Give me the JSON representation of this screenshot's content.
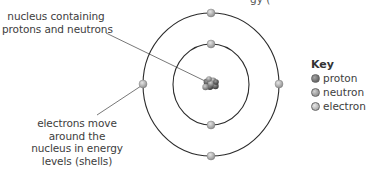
{
  "title_fragment": "gy        (",
  "labels": {
    "nucleus": [
      "nucleus containing",
      "protons and neutrons"
    ],
    "electrons": [
      "electrons move",
      "around the",
      "nucleus in energy",
      "levels (shells)"
    ]
  },
  "key": {
    "title": "Key",
    "items": [
      {
        "label": "proton",
        "color": "#6e6e6e"
      },
      {
        "label": "neutron",
        "color": "#9a9a9a"
      },
      {
        "label": "electron",
        "color": "#b3b3b3"
      }
    ]
  },
  "atom": {
    "center": [
      211,
      84
    ],
    "shells": [
      {
        "radius": 40,
        "electrons": 2
      },
      {
        "radius": 70,
        "electrons": 4
      }
    ],
    "line_color": "#2b2b2b",
    "electron_color": "#b8b8b8"
  }
}
